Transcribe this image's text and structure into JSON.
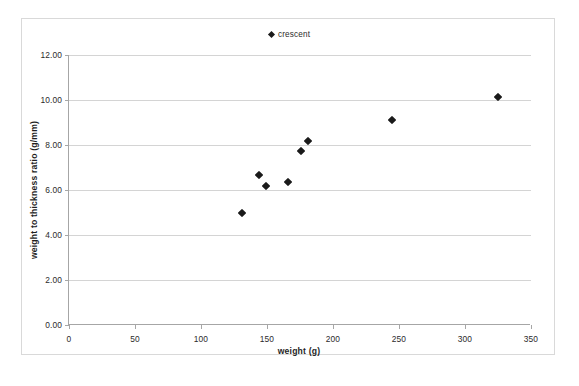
{
  "chart_data": {
    "type": "scatter",
    "title": "",
    "xlabel": "weight (g)",
    "ylabel": "weight to thickness ratio (g/mm)",
    "xlim": [
      0,
      350
    ],
    "ylim": [
      0,
      12
    ],
    "xticks": [
      "0",
      "50",
      "100",
      "150",
      "200",
      "250",
      "300",
      "350"
    ],
    "xtick_values": [
      0,
      50,
      100,
      150,
      200,
      250,
      300,
      350
    ],
    "yticks": [
      "0.00",
      "2.00",
      "4.00",
      "6.00",
      "8.00",
      "10.00",
      "12.00"
    ],
    "ytick_values": [
      0,
      2,
      4,
      6,
      8,
      10,
      12
    ],
    "grid": "horizontal",
    "legend_position": "top-center",
    "marker": "diamond",
    "marker_color": "#1a1a1a",
    "series": [
      {
        "name": "crescent",
        "points": [
          {
            "x": 131,
            "y": 5.0
          },
          {
            "x": 144,
            "y": 6.65
          },
          {
            "x": 149,
            "y": 6.2
          },
          {
            "x": 166,
            "y": 6.35
          },
          {
            "x": 176,
            "y": 7.75
          },
          {
            "x": 181,
            "y": 8.2
          },
          {
            "x": 245,
            "y": 9.1
          },
          {
            "x": 325,
            "y": 10.15
          }
        ]
      }
    ]
  },
  "legend": {
    "entries": [
      {
        "label": "crescent"
      }
    ]
  },
  "colors": {
    "marker": "#1a1a1a",
    "gridline": "#d4d4d4",
    "axis": "#a6a6a6",
    "border": "#d9d9d9",
    "text": "#2b2b2b",
    "background": "#ffffff"
  }
}
